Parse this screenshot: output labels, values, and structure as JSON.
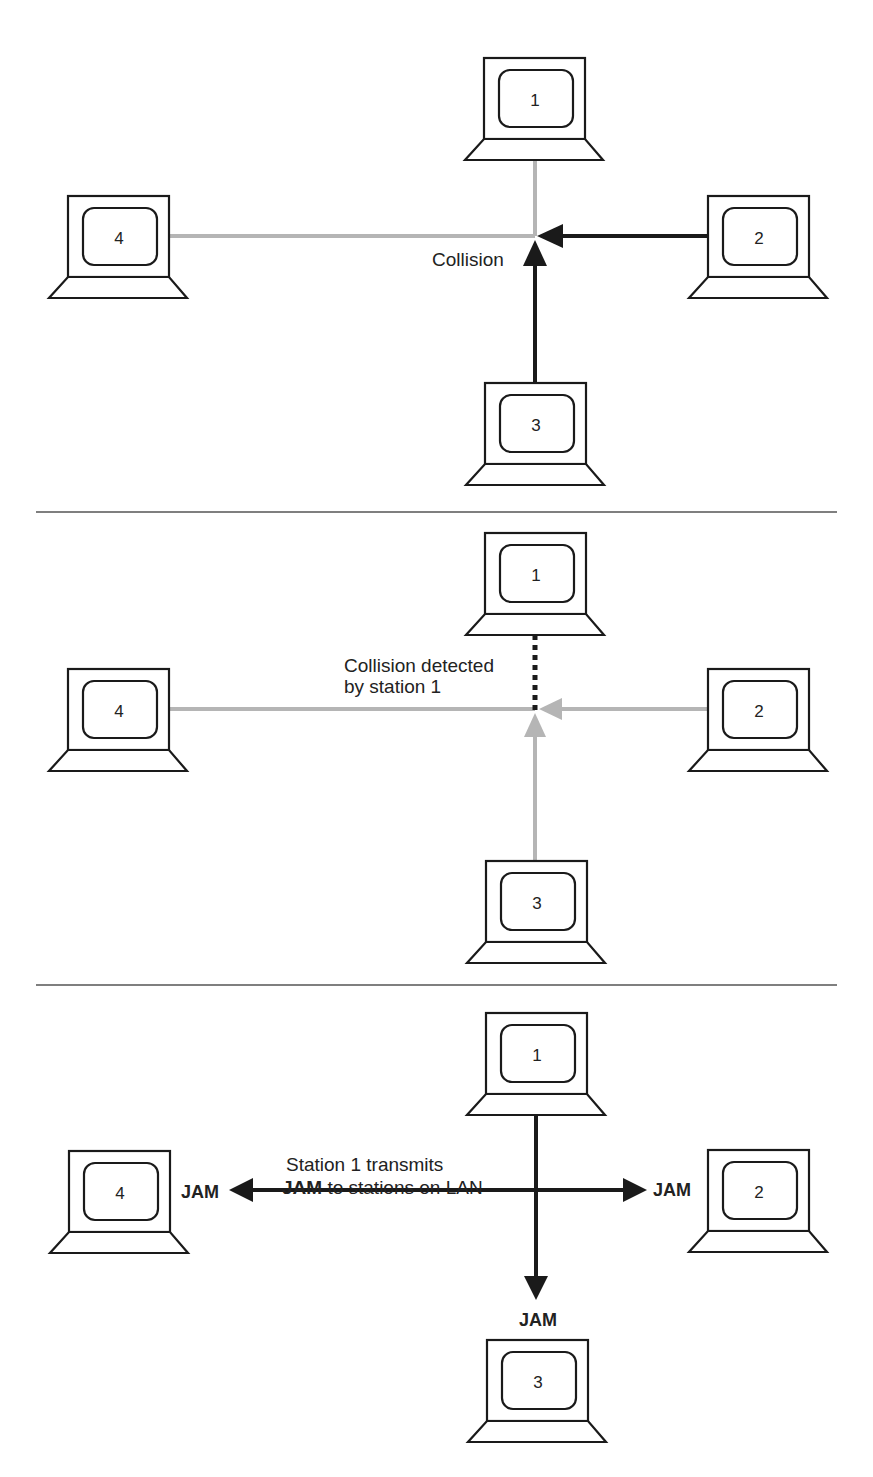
{
  "colors": {
    "stroke": "#1a1a1a",
    "active_line": "#1a1a1a",
    "idle_line": "#b5b5b5",
    "divider": "#555555",
    "background": "#ffffff"
  },
  "panels": [
    {
      "id": "collision",
      "stations": [
        {
          "label": "1"
        },
        {
          "label": "2"
        },
        {
          "label": "3"
        },
        {
          "label": "4"
        }
      ],
      "annotation": "Collision"
    },
    {
      "id": "detection",
      "stations": [
        {
          "label": "1"
        },
        {
          "label": "2"
        },
        {
          "label": "3"
        },
        {
          "label": "4"
        }
      ],
      "annotation_line1": "Collision detected",
      "annotation_line2": "by station 1"
    },
    {
      "id": "jam",
      "stations": [
        {
          "label": "1"
        },
        {
          "label": "2"
        },
        {
          "label": "3"
        },
        {
          "label": "4"
        }
      ],
      "annotation_line1": "Station 1 transmits",
      "annotation_line2_bold": "JAM",
      "annotation_line2_rest": " to stations on LAN",
      "jam_left": "JAM",
      "jam_right": "JAM",
      "jam_bottom": "JAM"
    }
  ]
}
